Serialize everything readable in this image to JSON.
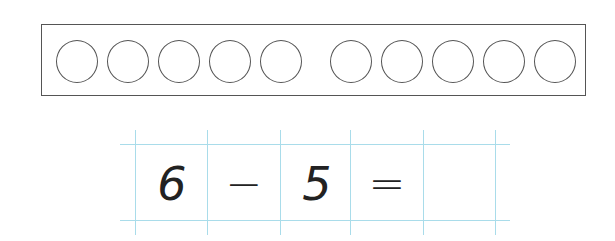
{
  "ten_frame": {
    "left_group_circles": 5,
    "right_group_circles": 5,
    "total_circles": 10
  },
  "equation": {
    "cells": [
      "6",
      "−",
      "5",
      "=",
      ""
    ],
    "minuend": "6",
    "operator": "−",
    "subtrahend": "5",
    "equals": "=",
    "answer": ""
  },
  "colors": {
    "grid_line": "#a9dcea",
    "outline": "#555555",
    "text": "#222222"
  }
}
